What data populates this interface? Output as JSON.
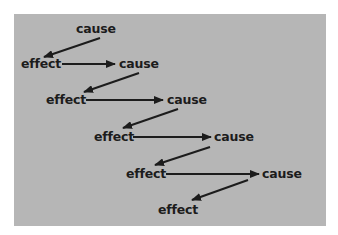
{
  "diagram": {
    "title": "",
    "background_color": "#b6b6b6",
    "text_color": "#1c1c1c",
    "nodes": [
      {
        "id": "cause-1",
        "label": "cause",
        "x": 76,
        "y": 22
      },
      {
        "id": "effect-1",
        "label": "effect",
        "x": 22,
        "y": 57
      },
      {
        "id": "cause-2",
        "label": "cause",
        "x": 119,
        "y": 57
      },
      {
        "id": "effect-2",
        "label": "effect",
        "x": 47,
        "y": 93
      },
      {
        "id": "cause-3",
        "label": "cause",
        "x": 167,
        "y": 93
      },
      {
        "id": "effect-3",
        "label": "effect",
        "x": 95,
        "y": 130
      },
      {
        "id": "cause-4",
        "label": "cause",
        "x": 214,
        "y": 130
      },
      {
        "id": "effect-4",
        "label": "effect",
        "x": 127,
        "y": 167
      },
      {
        "id": "cause-5",
        "label": "cause",
        "x": 262,
        "y": 167
      },
      {
        "id": "effect-5",
        "label": "effect",
        "x": 159,
        "y": 203
      }
    ],
    "edges": [
      {
        "from": "cause-1",
        "to": "effect-1"
      },
      {
        "from": "effect-1",
        "to": "cause-2"
      },
      {
        "from": "cause-2",
        "to": "effect-2"
      },
      {
        "from": "effect-2",
        "to": "cause-3"
      },
      {
        "from": "cause-3",
        "to": "effect-3"
      },
      {
        "from": "effect-3",
        "to": "cause-4"
      },
      {
        "from": "cause-4",
        "to": "effect-4"
      },
      {
        "from": "effect-4",
        "to": "cause-5"
      },
      {
        "from": "cause-5",
        "to": "effect-5"
      }
    ]
  }
}
